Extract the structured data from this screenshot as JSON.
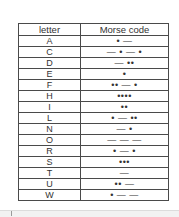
{
  "table": {
    "headers": [
      "letter",
      "Morse code"
    ],
    "rows": [
      {
        "letter": "A",
        "code": "• —"
      },
      {
        "letter": "C",
        "code": "— • — •"
      },
      {
        "letter": "D",
        "code": "— ••"
      },
      {
        "letter": "E",
        "code": "•"
      },
      {
        "letter": "F",
        "code": "•• — •"
      },
      {
        "letter": "H",
        "code": "••••"
      },
      {
        "letter": "I",
        "code": "••"
      },
      {
        "letter": "L",
        "code": "• — ••"
      },
      {
        "letter": "N",
        "code": "— •"
      },
      {
        "letter": "O",
        "code": "— — —"
      },
      {
        "letter": "R",
        "code": "• — •"
      },
      {
        "letter": "S",
        "code": "•••"
      },
      {
        "letter": "T",
        "code": "—"
      },
      {
        "letter": "U",
        "code": "•• —"
      },
      {
        "letter": "W",
        "code": "• — —"
      }
    ]
  }
}
